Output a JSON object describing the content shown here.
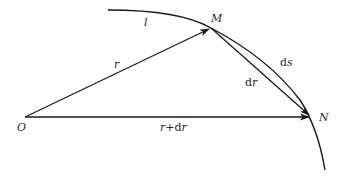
{
  "diagram": {
    "type": "geometry-vector",
    "colors": {
      "stroke": "#1a1a1a",
      "text": "#2a2a2a",
      "background": "#ffffff"
    },
    "points": {
      "O": {
        "label": "O",
        "x": 25,
        "y": 117
      },
      "M": {
        "label": "M",
        "x": 211,
        "y": 28
      },
      "N": {
        "label": "N",
        "x": 311,
        "y": 117
      }
    },
    "curve": {
      "label": "l"
    },
    "vectors": {
      "r": {
        "label": "r",
        "from": "O",
        "to": "M"
      },
      "r_plus_dr": {
        "label_main": "r",
        "label_op": "+",
        "label_d": "d",
        "label_var": "r",
        "from": "O",
        "to": "N"
      },
      "dr": {
        "label_d": "d",
        "label_var": "r",
        "from": "M",
        "to": "N"
      }
    },
    "arc": {
      "label_d": "d",
      "label_var": "s"
    }
  }
}
